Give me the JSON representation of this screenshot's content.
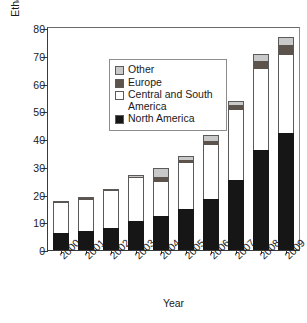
{
  "chart_data": {
    "type": "bar",
    "subtype": "stacked-bar",
    "title": "",
    "xlabel": "Year",
    "ylabel": "Ethanol production (billion liters)",
    "categories": [
      "2000",
      "2001",
      "2002",
      "2003",
      "2004",
      "2005",
      "2006",
      "2007",
      "2008",
      "2009"
    ],
    "ylim": [
      0,
      80
    ],
    "yticks": [
      0,
      10,
      20,
      30,
      40,
      50,
      60,
      70,
      80
    ],
    "grid": false,
    "legend_position": "upper-left-inside",
    "series": [
      {
        "name": "North America",
        "color": "#161616",
        "values": [
          6.2,
          7.0,
          8.1,
          10.6,
          12.2,
          14.8,
          18.5,
          25.3,
          36.0,
          42.3
        ]
      },
      {
        "name": "Central and South America",
        "color": "#ffffff",
        "values": [
          10.6,
          11.2,
          13.2,
          15.3,
          12.3,
          16.6,
          19.3,
          25.1,
          29.4,
          28.0
        ]
      },
      {
        "name": "Europe",
        "color": "#5d534d",
        "values": [
          0.3,
          0.3,
          0.4,
          0.5,
          1.7,
          1.0,
          1.6,
          1.8,
          2.7,
          3.6
        ]
      },
      {
        "name": "Other",
        "color": "#c9c9c9",
        "values": [
          0.4,
          0.4,
          0.4,
          0.8,
          3.3,
          1.5,
          2.1,
          1.5,
          2.6,
          3.0
        ]
      }
    ],
    "totals": [
      17.5,
      18.9,
      22.1,
      27.2,
      29.5,
      33.9,
      41.5,
      53.7,
      70.7,
      76.9
    ]
  },
  "legend": {
    "entries": [
      {
        "label": "Other",
        "swatch": "other-swatch"
      },
      {
        "label": "Europe",
        "swatch": "europe-swatch"
      },
      {
        "label": "Central and South America",
        "swatch": "central-south-america-swatch"
      },
      {
        "label": "North America",
        "swatch": "north-america-swatch"
      }
    ]
  },
  "axes": {
    "y_title": "Ethanol production (billion liters)",
    "x_title": "Year",
    "y_tick_labels": [
      "0",
      "10",
      "20",
      "30",
      "40",
      "50",
      "60",
      "70",
      "80"
    ],
    "x_tick_labels": [
      "2000",
      "2001",
      "2002",
      "2003",
      "2004",
      "2005",
      "2006",
      "2007",
      "2008",
      "2009"
    ]
  }
}
